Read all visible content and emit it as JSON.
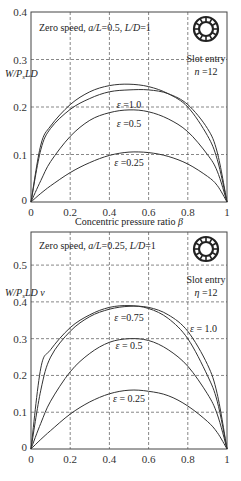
{
  "chart_data": [
    {
      "type": "line",
      "title": "Zero speed, a/L=0.5, L/D=1",
      "xlabel": "Concentric pressure ratio β",
      "ylabel": "W/PsLD",
      "xlim": [
        0,
        1
      ],
      "ylim": [
        0,
        0.4
      ],
      "xticks": [
        "0",
        "0.2",
        "0.4",
        "0.6",
        "0.8",
        "1"
      ],
      "yticks": [
        "0",
        "0.1",
        "0.2",
        "0.3",
        "0.4"
      ],
      "grid": true,
      "annotation": {
        "line1": "Slot entry",
        "line2": "n =12",
        "icon": "slot-entry-ring-icon"
      },
      "x": [
        0,
        0.05,
        0.1,
        0.2,
        0.3,
        0.4,
        0.5,
        0.6,
        0.7,
        0.8,
        0.9,
        0.95,
        1.0
      ],
      "series": [
        {
          "name": "ε =0.75",
          "values": [
            0,
            0.12,
            0.16,
            0.205,
            0.232,
            0.245,
            0.248,
            0.243,
            0.228,
            0.2,
            0.14,
            0.09,
            0
          ]
        },
        {
          "name": "ε =1.0",
          "values": [
            0,
            0.11,
            0.155,
            0.195,
            0.218,
            0.232,
            0.236,
            0.236,
            0.228,
            0.205,
            0.155,
            0.105,
            0
          ]
        },
        {
          "name": "ε =0.5",
          "values": [
            0,
            0.045,
            0.085,
            0.138,
            0.172,
            0.188,
            0.194,
            0.19,
            0.175,
            0.148,
            0.1,
            0.065,
            0
          ]
        },
        {
          "name": "ε =0.25",
          "values": [
            0,
            0.018,
            0.034,
            0.062,
            0.083,
            0.098,
            0.105,
            0.104,
            0.096,
            0.08,
            0.054,
            0.035,
            0
          ]
        }
      ]
    },
    {
      "type": "line",
      "title": "Zero speed, a/L=0.25, L/D=1",
      "xlabel": "",
      "ylabel": "W/PsLD v",
      "xlim": [
        0,
        1
      ],
      "ylim": [
        0,
        0.59
      ],
      "xticks": [
        "0",
        "0.2",
        "0.4",
        "0.6",
        "0.8",
        "1"
      ],
      "yticks": [
        "0",
        "0.1",
        "0.2",
        "0.3",
        "0.4",
        "0.5"
      ],
      "grid": true,
      "annotation": {
        "line1": "Slot entry",
        "line2": "η =12",
        "icon": "slot-entry-ring-icon"
      },
      "x": [
        0,
        0.05,
        0.1,
        0.2,
        0.3,
        0.4,
        0.5,
        0.6,
        0.7,
        0.8,
        0.9,
        0.95,
        1.0
      ],
      "series": [
        {
          "name": "ε =0.75",
          "values": [
            0,
            0.22,
            0.27,
            0.33,
            0.365,
            0.385,
            0.39,
            0.382,
            0.355,
            0.3,
            0.2,
            0.13,
            0
          ]
        },
        {
          "name": "ε = 1.0",
          "values": [
            0,
            0.16,
            0.25,
            0.32,
            0.36,
            0.38,
            0.388,
            0.385,
            0.365,
            0.32,
            0.23,
            0.15,
            0
          ]
        },
        {
          "name": "ε = 0.5",
          "values": [
            0,
            0.07,
            0.13,
            0.21,
            0.26,
            0.29,
            0.3,
            0.295,
            0.27,
            0.225,
            0.15,
            0.095,
            0
          ]
        },
        {
          "name": "ε = 0.25",
          "values": [
            0,
            0.026,
            0.05,
            0.095,
            0.128,
            0.15,
            0.16,
            0.157,
            0.145,
            0.117,
            0.075,
            0.045,
            0
          ]
        }
      ]
    }
  ]
}
